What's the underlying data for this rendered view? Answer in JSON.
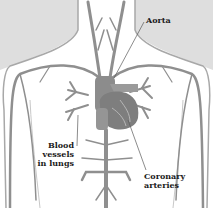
{
  "diagram": {
    "type": "anatomical-illustration",
    "labels": {
      "aorta": "Aorta",
      "lungs_line1": "Blood vessels",
      "lungs_line2": "in lungs",
      "coronary_line1": "Coronary",
      "coronary_line2": "arteries"
    },
    "colors": {
      "background": "#ffffff",
      "shading": "#d9d9d9",
      "body_outline": "#9a9a9a",
      "vessel": "#8a8a8a",
      "heart": "#7a7a7a",
      "text": "#1a1a1a"
    }
  }
}
